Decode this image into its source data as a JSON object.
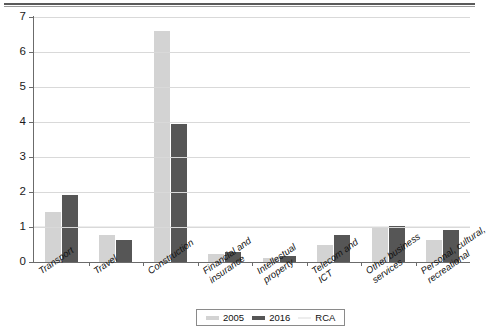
{
  "chart_data": {
    "type": "bar",
    "title": "",
    "subtitle": "",
    "xlabel": "",
    "ylabel": "",
    "ylim": [
      0,
      7
    ],
    "yticks": [
      0,
      1,
      2,
      3,
      4,
      5,
      6,
      7
    ],
    "ytick_labels": [
      "0",
      "1",
      "2",
      "3",
      "4",
      "5",
      "6",
      "7"
    ],
    "grid": true,
    "legend_position": "bottom",
    "categories": [
      "Transport",
      "Travel",
      "Construction",
      "Financial and\ninsurance",
      "Intellectual\nproperty",
      "Telecom and\nICT",
      "Other business\nservices",
      "Personal, cultural,\nrecreational"
    ],
    "series": [
      {
        "name": "2005",
        "color": "#d3d3d3",
        "values": [
          1.42,
          0.77,
          6.6,
          0.22,
          0.12,
          0.48,
          1.0,
          0.63
        ]
      },
      {
        "name": "2016",
        "color": "#565656",
        "values": [
          1.92,
          0.62,
          3.93,
          0.28,
          0.17,
          0.78,
          1.02,
          0.92
        ]
      }
    ],
    "reference_line": {
      "name": "RCA",
      "value": 1,
      "color": "#ededed"
    },
    "legend": [
      {
        "label": "2005",
        "marker": "bar",
        "color": "#d3d3d3"
      },
      {
        "label": "2016",
        "marker": "bar",
        "color": "#565656"
      },
      {
        "label": "RCA",
        "marker": "line",
        "color": "#ededed"
      }
    ]
  },
  "figure": {
    "axis_color": "#6b6b6b",
    "grid_color": "#d9d9d9",
    "background": "#ffffff",
    "top_rule": true
  }
}
